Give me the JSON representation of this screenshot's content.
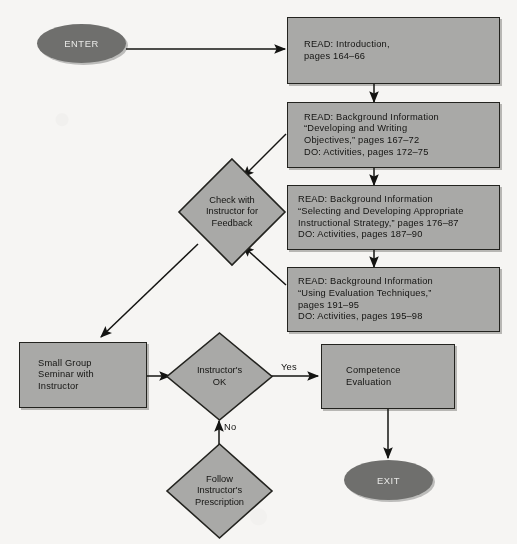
{
  "diagram": {
    "type": "flowchart",
    "colors": {
      "process_fill": "#a9a9a7",
      "terminator_fill": "#6f6f6d",
      "stroke": "#23231f",
      "background": "#f6f5f3",
      "text": "#141412",
      "terminator_text": "#e9e9e7"
    },
    "nodes": {
      "enter": {
        "label": "ENTER",
        "shape": "ellipse"
      },
      "read_intro": {
        "label": "READ: Introduction,\npages 164–66",
        "shape": "process"
      },
      "read_objectives": {
        "label": "READ: Background Information\n“Developing and Writing\nObjectives,” pages 167–72\nDO: Activities, pages 172–75",
        "shape": "process"
      },
      "read_strategy": {
        "label": "READ: Background Information\n“Selecting and Developing Appropriate\nInstructional Strategy,” pages 176–87\nDO: Activities, pages 187–90",
        "shape": "process"
      },
      "read_evaluation": {
        "label": "READ: Background Information\n“Using Evaluation Techniques,”\npages 191–95\nDO: Activities, pages 195–98",
        "shape": "process"
      },
      "check_instructor": {
        "label": "Check with\nInstructor for\nFeedback",
        "shape": "diamond"
      },
      "small_group": {
        "label": "Small Group\nSeminar with\nInstructor",
        "shape": "process"
      },
      "instructor_ok": {
        "label": "Instructor's\nOK",
        "shape": "diamond"
      },
      "competence_eval": {
        "label": "Competence\nEvaluation",
        "shape": "process"
      },
      "follow_prescription": {
        "label": "Follow\nInstructor's\nPrescription",
        "shape": "diamond"
      },
      "exit": {
        "label": "EXIT",
        "shape": "ellipse"
      }
    },
    "edge_labels": {
      "yes": "Yes",
      "no": "No"
    },
    "edges": [
      {
        "from": "enter",
        "to": "read_intro",
        "label": ""
      },
      {
        "from": "read_intro",
        "to": "read_objectives",
        "label": ""
      },
      {
        "from": "read_objectives",
        "to": "check_instructor",
        "label": ""
      },
      {
        "from": "read_objectives",
        "to": "read_strategy",
        "label": ""
      },
      {
        "from": "read_strategy",
        "to": "check_instructor",
        "label": ""
      },
      {
        "from": "read_strategy",
        "to": "read_evaluation",
        "label": ""
      },
      {
        "from": "read_evaluation",
        "to": "check_instructor",
        "label": ""
      },
      {
        "from": "check_instructor",
        "to": "small_group",
        "label": ""
      },
      {
        "from": "small_group",
        "to": "instructor_ok",
        "label": ""
      },
      {
        "from": "instructor_ok",
        "to": "competence_eval",
        "label": "Yes"
      },
      {
        "from": "instructor_ok",
        "to": "follow_prescription",
        "label": "No"
      },
      {
        "from": "follow_prescription",
        "to": "instructor_ok",
        "label": ""
      },
      {
        "from": "competence_eval",
        "to": "exit",
        "label": ""
      }
    ]
  }
}
